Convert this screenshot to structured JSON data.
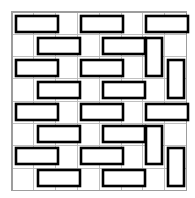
{
  "figure": {
    "type": "pattern-diagram",
    "width": 195,
    "height": 198,
    "background_color": "#ffffff"
  },
  "grid": {
    "origin_x": 12,
    "origin_y": 12,
    "cell_width": 21.8,
    "cell_height": 22.3,
    "columns": 8,
    "rows": 8,
    "line_color": "#b9b9b9",
    "border_color": "#9d9d9d",
    "line_width": 0.9,
    "visible": true
  },
  "brick_style": {
    "fill_color": "#ffffff",
    "stroke_color": "#000000",
    "stroke_width": 2.6
  },
  "bricks": [
    {
      "id": "brick-r1-c1",
      "orientation": "horizontal",
      "x": 16,
      "y": 16,
      "w": 42,
      "h": 16
    },
    {
      "id": "brick-r1-c2",
      "orientation": "horizontal",
      "x": 81,
      "y": 16,
      "w": 42,
      "h": 16
    },
    {
      "id": "brick-r1-c3",
      "orientation": "horizontal",
      "x": 146,
      "y": 16,
      "w": 42,
      "h": 16
    },
    {
      "id": "brick-r2-c1",
      "orientation": "horizontal",
      "x": 38,
      "y": 38,
      "w": 42,
      "h": 16
    },
    {
      "id": "brick-r2-c2",
      "orientation": "horizontal",
      "x": 103,
      "y": 38,
      "w": 42,
      "h": 16
    },
    {
      "id": "brick-r2-c3",
      "orientation": "vertical",
      "x": 146,
      "y": 38,
      "w": 16,
      "h": 38
    },
    {
      "id": "brick-r3-c1",
      "orientation": "horizontal",
      "x": 16,
      "y": 60,
      "w": 42,
      "h": 16
    },
    {
      "id": "brick-r3-c2",
      "orientation": "horizontal",
      "x": 81,
      "y": 60,
      "w": 42,
      "h": 16
    },
    {
      "id": "brick-r3-c3",
      "orientation": "vertical",
      "x": 168,
      "y": 60,
      "w": 16,
      "h": 38
    },
    {
      "id": "brick-r4-c1",
      "orientation": "horizontal",
      "x": 38,
      "y": 82,
      "w": 42,
      "h": 16
    },
    {
      "id": "brick-r4-c2",
      "orientation": "horizontal",
      "x": 103,
      "y": 82,
      "w": 42,
      "h": 16
    },
    {
      "id": "brick-r5-c1",
      "orientation": "horizontal",
      "x": 16,
      "y": 104,
      "w": 42,
      "h": 16
    },
    {
      "id": "brick-r5-c2",
      "orientation": "horizontal",
      "x": 81,
      "y": 104,
      "w": 42,
      "h": 16
    },
    {
      "id": "brick-r5-c3",
      "orientation": "horizontal",
      "x": 146,
      "y": 104,
      "w": 42,
      "h": 16
    },
    {
      "id": "brick-r6-c1",
      "orientation": "horizontal",
      "x": 38,
      "y": 126,
      "w": 42,
      "h": 16
    },
    {
      "id": "brick-r6-c2",
      "orientation": "horizontal",
      "x": 103,
      "y": 126,
      "w": 42,
      "h": 16
    },
    {
      "id": "brick-r6-c3",
      "orientation": "vertical",
      "x": 146,
      "y": 126,
      "w": 16,
      "h": 38
    },
    {
      "id": "brick-r7-c1",
      "orientation": "horizontal",
      "x": 16,
      "y": 148,
      "w": 42,
      "h": 16
    },
    {
      "id": "brick-r7-c2",
      "orientation": "horizontal",
      "x": 81,
      "y": 148,
      "w": 42,
      "h": 16
    },
    {
      "id": "brick-r7-c3",
      "orientation": "vertical",
      "x": 168,
      "y": 148,
      "w": 16,
      "h": 38
    },
    {
      "id": "brick-r8-c1",
      "orientation": "horizontal",
      "x": 38,
      "y": 170,
      "w": 42,
      "h": 16
    },
    {
      "id": "brick-r8-c2",
      "orientation": "horizontal",
      "x": 103,
      "y": 170,
      "w": 42,
      "h": 16
    }
  ]
}
